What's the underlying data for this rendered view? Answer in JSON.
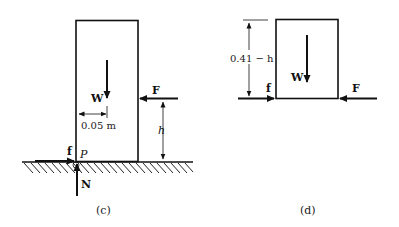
{
  "figure_c": {
    "caption": "(c)",
    "labels": {
      "weight": "W",
      "force": "F",
      "friction": "f",
      "normal": "N",
      "point": "P",
      "offset": "0.05 m",
      "height": "h"
    }
  },
  "figure_d": {
    "caption": "(d)",
    "labels": {
      "weight": "W",
      "force": "F",
      "friction": "f",
      "height": "0.41 − h"
    }
  },
  "colors": {
    "ink": "#111111",
    "background": "#ffffff"
  }
}
